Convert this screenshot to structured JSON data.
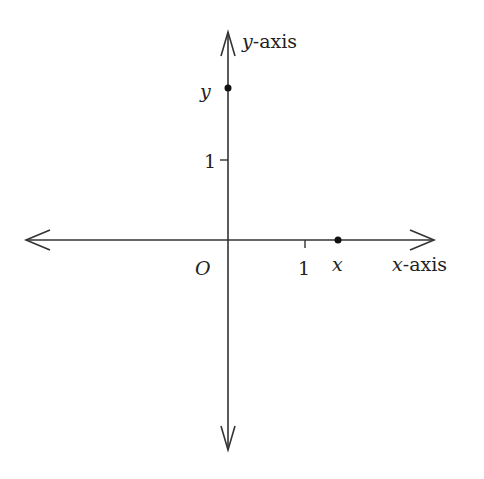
{
  "diagram": {
    "type": "cartesian-axes",
    "x_axis_label": "x-axis",
    "x_axis_var": "x",
    "x_axis_suffix": "-axis",
    "y_axis_label": "y-axis",
    "y_axis_var": "y",
    "y_axis_suffix": "-axis",
    "origin_label": "O",
    "x_tick_label": "1",
    "y_tick_label": "1",
    "points": [
      {
        "name": "x",
        "label": "x",
        "position": "on x-axis, approx 1.4 units"
      },
      {
        "name": "y",
        "label": "y",
        "position": "on y-axis, approx 2 units"
      }
    ],
    "colors": {
      "ink": "#222222",
      "background": "#ffffff"
    }
  }
}
